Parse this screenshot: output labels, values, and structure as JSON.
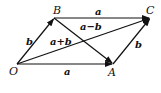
{
  "diagram": {
    "points": {
      "O": {
        "label": "O",
        "x": 17,
        "y": 64
      },
      "A": {
        "label": "A",
        "x": 113,
        "y": 64
      },
      "B": {
        "label": "B",
        "x": 54,
        "y": 18
      },
      "C": {
        "label": "C",
        "x": 150,
        "y": 18
      }
    },
    "vectors": [
      {
        "from": "O",
        "to": "A",
        "label": "a"
      },
      {
        "from": "B",
        "to": "C",
        "label": "a"
      },
      {
        "from": "O",
        "to": "B",
        "label": "b"
      },
      {
        "from": "A",
        "to": "C",
        "label": "b"
      },
      {
        "from": "O",
        "to": "C",
        "label": "a+b"
      },
      {
        "from": "B",
        "to": "A",
        "label": "a−b"
      }
    ]
  }
}
